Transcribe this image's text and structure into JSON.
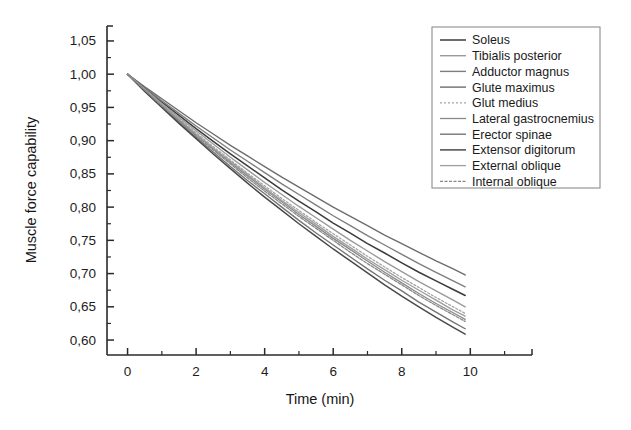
{
  "chart_data": {
    "type": "line",
    "title": "",
    "xlabel": "Time (min)",
    "ylabel": "Muscle force capability",
    "xlim": [
      -0.6,
      11.8
    ],
    "ylim": [
      0.5775,
      1.0725
    ],
    "xticks": [
      0,
      2,
      4,
      6,
      8,
      10
    ],
    "xtick_labels": [
      "0",
      "2",
      "4",
      "6",
      "8",
      "10"
    ],
    "xminor_ticks": [
      1,
      3,
      5,
      7,
      9,
      11
    ],
    "yticks": [
      0.6,
      0.65,
      0.7,
      0.75,
      0.8,
      0.85,
      0.9,
      0.95,
      1.0,
      1.05
    ],
    "ytick_labels": [
      "0,60",
      "0,65",
      "0,70",
      "0,75",
      "0,80",
      "0,85",
      "0,90",
      "0,95",
      "1,00",
      "1,05"
    ],
    "yminor_ticks": [
      0.625,
      0.675,
      0.725,
      0.775,
      0.825,
      0.875,
      0.925,
      0.975,
      1.025
    ],
    "grid": false,
    "legend_position": "top-right",
    "x": [
      0,
      0.5,
      1,
      1.5,
      2,
      2.5,
      3,
      3.5,
      4,
      4.5,
      5,
      5.5,
      6,
      6.5,
      7,
      7.5,
      8,
      8.5,
      9,
      9.5,
      9.85
    ],
    "series": [
      {
        "name": "Soleus",
        "color": "#3b3b3b",
        "dash": "none",
        "width": 1.5,
        "values": [
          1.0,
          0.979,
          0.958,
          0.938,
          0.918,
          0.899,
          0.88,
          0.862,
          0.844,
          0.826,
          0.809,
          0.793,
          0.776,
          0.761,
          0.745,
          0.731,
          0.716,
          0.702,
          0.689,
          0.676,
          0.667
        ]
      },
      {
        "name": "Tibialis posterior",
        "color": "#9a9a9a",
        "dash": "none",
        "width": 1.4,
        "values": [
          1.0,
          0.978,
          0.956,
          0.935,
          0.915,
          0.895,
          0.875,
          0.856,
          0.837,
          0.819,
          0.801,
          0.784,
          0.767,
          0.75,
          0.734,
          0.718,
          0.703,
          0.688,
          0.674,
          0.66,
          0.65
        ]
      },
      {
        "name": "Adductor magnus",
        "color": "#7e7e7e",
        "dash": "none",
        "width": 1.4,
        "values": [
          1.0,
          0.98,
          0.96,
          0.941,
          0.922,
          0.904,
          0.886,
          0.869,
          0.852,
          0.835,
          0.819,
          0.803,
          0.787,
          0.772,
          0.757,
          0.743,
          0.729,
          0.715,
          0.702,
          0.689,
          0.68
        ]
      },
      {
        "name": "Glute maximus",
        "color": "#6d6d6d",
        "dash": "none",
        "width": 1.4,
        "values": [
          1.0,
          0.981,
          0.963,
          0.945,
          0.927,
          0.91,
          0.893,
          0.877,
          0.861,
          0.845,
          0.83,
          0.815,
          0.8,
          0.786,
          0.772,
          0.758,
          0.745,
          0.732,
          0.719,
          0.707,
          0.698
        ]
      },
      {
        "name": "Glut medius",
        "color": "#a5a5a5",
        "dash": "2,2",
        "width": 1.3,
        "values": [
          1.0,
          0.977,
          0.955,
          0.933,
          0.912,
          0.891,
          0.871,
          0.851,
          0.832,
          0.813,
          0.795,
          0.777,
          0.76,
          0.743,
          0.726,
          0.71,
          0.694,
          0.679,
          0.664,
          0.65,
          0.64
        ]
      },
      {
        "name": "Lateral gastrocnemius",
        "color": "#8a8a8a",
        "dash": "none",
        "width": 1.3,
        "values": [
          1.0,
          0.976,
          0.953,
          0.931,
          0.909,
          0.888,
          0.867,
          0.847,
          0.827,
          0.808,
          0.789,
          0.771,
          0.753,
          0.736,
          0.719,
          0.702,
          0.686,
          0.67,
          0.655,
          0.641,
          0.631
        ]
      },
      {
        "name": "Erector spinae",
        "color": "#757575",
        "dash": "none",
        "width": 1.4,
        "values": [
          1.0,
          0.975,
          0.951,
          0.928,
          0.905,
          0.883,
          0.861,
          0.84,
          0.82,
          0.8,
          0.78,
          0.761,
          0.743,
          0.725,
          0.707,
          0.69,
          0.674,
          0.657,
          0.642,
          0.627,
          0.617
        ]
      },
      {
        "name": "Extensor digitorum",
        "color": "#4a4a4a",
        "dash": "none",
        "width": 1.5,
        "values": [
          1.0,
          0.974,
          0.95,
          0.926,
          0.903,
          0.88,
          0.858,
          0.836,
          0.815,
          0.795,
          0.775,
          0.756,
          0.737,
          0.719,
          0.701,
          0.683,
          0.666,
          0.65,
          0.634,
          0.619,
          0.609
        ]
      },
      {
        "name": "External oblique",
        "color": "#9e9e9e",
        "dash": "none",
        "width": 1.3,
        "values": [
          1.0,
          0.977,
          0.954,
          0.932,
          0.91,
          0.889,
          0.869,
          0.849,
          0.829,
          0.81,
          0.792,
          0.774,
          0.756,
          0.739,
          0.722,
          0.706,
          0.69,
          0.675,
          0.66,
          0.645,
          0.636
        ]
      },
      {
        "name": "Internal oblique",
        "color": "#888888",
        "dash": "3,1.5",
        "width": 1.3,
        "values": [
          1.0,
          0.976,
          0.952,
          0.93,
          0.907,
          0.886,
          0.865,
          0.844,
          0.824,
          0.805,
          0.786,
          0.768,
          0.75,
          0.732,
          0.715,
          0.699,
          0.683,
          0.667,
          0.652,
          0.638,
          0.628
        ]
      }
    ]
  }
}
